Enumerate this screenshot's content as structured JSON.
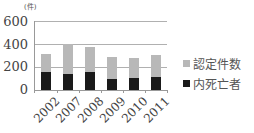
{
  "chart_data": {
    "type": "bar",
    "stacked": false,
    "overlay": true,
    "title": "",
    "unit_label": "(件)",
    "xlabel": "",
    "ylabel": "件",
    "ylim": [
      0,
      600
    ],
    "yticks": [
      0,
      200,
      400,
      600
    ],
    "grid": true,
    "legend_position": "right",
    "categories": [
      "2002",
      "2007",
      "2008",
      "2009",
      "2010",
      "2011"
    ],
    "series": [
      {
        "name": "認定件数",
        "color": "#b8b8b8",
        "values": [
          317,
          397,
          370,
          288,
          282,
          305
        ]
      },
      {
        "name": "内死亡者",
        "color": "#1a1a1a",
        "values": [
          156,
          136,
          153,
          100,
          106,
          115
        ]
      }
    ]
  },
  "axis": {
    "unit": "(件)",
    "yticks": [
      "600",
      "400",
      "200",
      "0"
    ]
  },
  "legend": [
    {
      "label": "認定件数",
      "color": "#b8b8b8"
    },
    {
      "label": "内死亡者",
      "color": "#1a1a1a"
    }
  ]
}
